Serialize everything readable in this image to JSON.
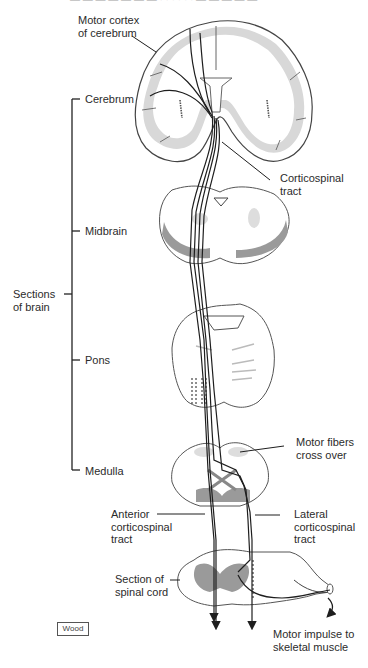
{
  "figure": {
    "top_caption_clipped": "— — — — — — — · · · · · · — — — — —",
    "credit": "Wood"
  },
  "labels": {
    "motor_cortex": "Motor cortex\nof cerebrum",
    "cerebrum": "Cerebrum",
    "corticospinal_tract": "Corticospinal\ntract",
    "midbrain": "Midbrain",
    "sections_of_brain": "Sections\nof brain",
    "pons": "Pons",
    "medulla": "Medulla",
    "motor_fibers_cross_over": "Motor fibers\ncross over",
    "anterior_corticospinal_tract": "Anterior\ncorticospinal\ntract",
    "lateral_corticospinal_tract": "Lateral\ncorticospinal\ntract",
    "section_of_spinal_cord": "Section of\nspinal cord",
    "motor_impulse": "Motor impulse to\nskeletal muscle"
  },
  "colors": {
    "line": "#1e1e1e",
    "gray_matter_light": "#d4d4d4",
    "gray_matter_dark": "#9a9a9a",
    "outline": "#555555"
  }
}
